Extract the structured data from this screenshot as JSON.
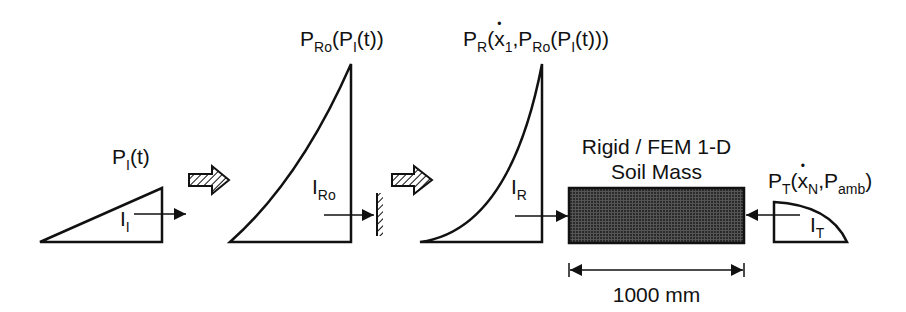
{
  "diagram": {
    "stages": [
      {
        "id": "incident",
        "pressure_label": {
          "main": "P",
          "sub": "I",
          "rest": "(t)"
        },
        "impulse_label": {
          "main": "I",
          "sub": "I"
        }
      },
      {
        "id": "reflected_rigid",
        "pressure_label": {
          "main": "P",
          "sub": "Ro",
          "rest_open": "(P",
          "rest_sub": "I",
          "rest_close": "(t))"
        },
        "impulse_label": {
          "main": "I",
          "sub": "Ro"
        }
      },
      {
        "id": "reflected",
        "pressure_label": {
          "main": "P",
          "sub": "R",
          "open": "(",
          "x": "x",
          "x_sub": "1",
          "comma": ",P",
          "sub2": "Ro",
          "rest_open": "(P",
          "rest_sub": "I",
          "rest_close": "(t)))"
        },
        "impulse_label": {
          "main": "I",
          "sub": "R"
        }
      },
      {
        "id": "transmitted",
        "pressure_label": {
          "main": "P",
          "sub": "T",
          "open": "(",
          "x": "x",
          "x_sub": "N",
          "comma": ",P",
          "sub2": "amb",
          "close": ")"
        },
        "impulse_label": {
          "main": "I",
          "sub": "T"
        }
      }
    ],
    "soil_mass": {
      "line1": "Rigid / FEM 1-D",
      "line2": "Soil Mass"
    },
    "dimension": {
      "label": "1000 mm"
    },
    "colors": {
      "stroke": "#111111",
      "fill_dark": "#3a3a3a",
      "background": "#ffffff"
    }
  }
}
